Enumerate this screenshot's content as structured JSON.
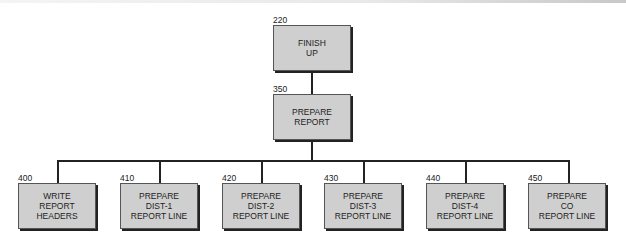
{
  "diagram": {
    "type": "hierarchy-chart",
    "nodes": [
      {
        "id": "220",
        "label": "FINISH\nUP",
        "level": 0
      },
      {
        "id": "350",
        "label": "PREPARE\nREPORT",
        "level": 1,
        "parent": "220"
      },
      {
        "id": "400",
        "label": "WRITE\nREPORT\nHEADERS",
        "level": 2,
        "parent": "350"
      },
      {
        "id": "410",
        "label": "PREPARE\nDIST-1\nREPORT LINE",
        "level": 2,
        "parent": "350"
      },
      {
        "id": "420",
        "label": "PREPARE\nDIST-2\nREPORT LINE",
        "level": 2,
        "parent": "350"
      },
      {
        "id": "430",
        "label": "PREPARE\nDIST-3\nREPORT LINE",
        "level": 2,
        "parent": "350"
      },
      {
        "id": "440",
        "label": "PREPARE\nDIST-4\nREPORT LINE",
        "level": 2,
        "parent": "350"
      },
      {
        "id": "450",
        "label": "PREPARE\nCO\nREPORT LINE",
        "level": 2,
        "parent": "350"
      }
    ]
  },
  "colors": {
    "box_fill": "#cfcfcf",
    "line": "#222222"
  }
}
